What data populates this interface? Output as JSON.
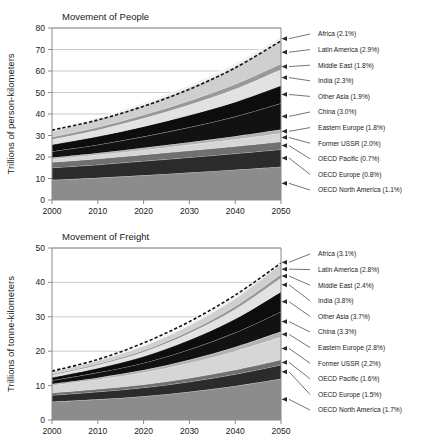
{
  "figure": {
    "background": "#ffffff",
    "panels": [
      "people",
      "freight"
    ]
  },
  "chart_data": [
    {
      "id": "people",
      "type": "area",
      "stacked": true,
      "title": "Movement of People",
      "xlabel": "",
      "ylabel": "Trillions of person-kilometers",
      "x": [
        2000,
        2010,
        2020,
        2030,
        2040,
        2050
      ],
      "xlim": [
        2000,
        2050
      ],
      "ylim": [
        0,
        80
      ],
      "yticks": [
        0,
        10,
        20,
        30,
        40,
        50,
        60,
        70,
        80
      ],
      "xticks": [
        2000,
        2010,
        2020,
        2030,
        2040,
        2050
      ],
      "xticklabels": [
        "2000",
        "2010",
        "2020",
        "2030",
        "2040",
        "2050"
      ],
      "yticklabels": [
        "0",
        "10",
        "20",
        "30",
        "40",
        "50",
        "60",
        "70",
        "80"
      ],
      "grid": "horizontal",
      "legend_position": "right-leader-lines",
      "total_line_label": "total (dashed)",
      "total": [
        32.5,
        37.2,
        43.6,
        51.5,
        61.5,
        74.0
      ],
      "series": [
        {
          "name": "OECD North America (1.1%)",
          "growth": "1.1%",
          "color": "#8c8c8c",
          "values": [
            9.3,
            10.3,
            11.5,
            12.8,
            14.1,
            15.5
          ]
        },
        {
          "name": "OECD Europe (0.8%)",
          "growth": "0.8%",
          "color": "#2b2b2b",
          "values": [
            5.7,
            6.1,
            6.6,
            7.0,
            7.5,
            8.0
          ]
        },
        {
          "name": "OECD Pacific (0.7%)",
          "growth": "0.7%",
          "color": "#707070",
          "values": [
            2.6,
            2.8,
            3.0,
            3.2,
            3.4,
            3.6
          ]
        },
        {
          "name": "Former USSR (2.0%)",
          "growth": "2.0%",
          "color": "#d6d6d6",
          "values": [
            1.5,
            1.9,
            2.2,
            2.7,
            3.3,
            4.0
          ]
        },
        {
          "name": "Eastern Europe (1.8%)",
          "growth": "1.8%",
          "color": "#b3b3b3",
          "values": [
            0.7,
            0.8,
            1.0,
            1.2,
            1.4,
            1.7
          ]
        },
        {
          "name": "China (3.0%)",
          "growth": "3.0%",
          "color": "#121212",
          "values": [
            2.8,
            3.8,
            5.2,
            6.9,
            9.1,
            12.2
          ]
        },
        {
          "name": "Other Asia (1.9%)",
          "growth": "1.9%",
          "color": "#0d0d0d",
          "values": [
            3.2,
            3.9,
            4.7,
            5.7,
            6.8,
            8.2
          ]
        },
        {
          "name": "India (2.3%)",
          "growth": "2.3%",
          "color": "#e2e2e2",
          "values": [
            2.4,
            3.0,
            3.8,
            4.8,
            6.0,
            7.5
          ]
        },
        {
          "name": "Middle East (1.8%)",
          "growth": "1.8%",
          "color": "#999999",
          "values": [
            1.1,
            1.3,
            1.6,
            1.9,
            2.3,
            2.7
          ]
        },
        {
          "name": "Latin America (2.9%)",
          "growth": "2.9%",
          "color": "#cfcfcf",
          "values": [
            2.6,
            3.5,
            4.6,
            6.1,
            8.1,
            10.7
          ]
        },
        {
          "name": "Africa (2.1%)",
          "growth": "2.1%",
          "color": "#f0f0f0",
          "values": [
            0.6,
            0.8,
            1.0,
            1.2,
            1.5,
            1.9
          ]
        }
      ]
    },
    {
      "id": "freight",
      "type": "area",
      "stacked": true,
      "title": "Movement of Freight",
      "xlabel": "",
      "ylabel": "Trillions of tonne-kilometers",
      "x": [
        2000,
        2010,
        2020,
        2030,
        2040,
        2050
      ],
      "xlim": [
        2000,
        2050
      ],
      "ylim": [
        0,
        50
      ],
      "yticks": [
        0,
        10,
        20,
        30,
        40,
        50
      ],
      "xticks": [
        2000,
        2010,
        2020,
        2030,
        2040,
        2050
      ],
      "xticklabels": [
        "2000",
        "2010",
        "2020",
        "2030",
        "2040",
        "2050"
      ],
      "yticklabels": [
        "0",
        "10",
        "20",
        "30",
        "40",
        "50"
      ],
      "grid": "horizontal",
      "legend_position": "right-leader-lines",
      "total_line_label": "total (dashed)",
      "total": [
        14.2,
        17.6,
        22.4,
        28.6,
        36.3,
        45.6
      ],
      "series": [
        {
          "name": "OECD North America (1.7%)",
          "growth": "1.7%",
          "color": "#8c8c8c",
          "values": [
            5.3,
            6.0,
            6.9,
            8.2,
            9.9,
            12.0
          ]
        },
        {
          "name": "OECD Europe (1.5%)",
          "growth": "1.5%",
          "color": "#2b2b2b",
          "values": [
            1.9,
            2.2,
            2.5,
            2.9,
            3.4,
            4.0
          ]
        },
        {
          "name": "OECD Pacific (1.6%)",
          "growth": "1.6%",
          "color": "#707070",
          "values": [
            0.7,
            0.8,
            0.9,
            1.1,
            1.3,
            1.5
          ]
        },
        {
          "name": "Former USSR (2.2%)",
          "growth": "2.2%",
          "color": "#d6d6d6",
          "values": [
            2.2,
            2.8,
            3.5,
            4.4,
            5.4,
            6.6
          ]
        },
        {
          "name": "Eastern Europe (2.8%)",
          "growth": "2.8%",
          "color": "#b3b3b3",
          "values": [
            0.4,
            0.5,
            0.7,
            0.9,
            1.2,
            1.6
          ]
        },
        {
          "name": "China (3.3%)",
          "growth": "3.3%",
          "color": "#121212",
          "values": [
            1.0,
            1.5,
            2.1,
            3.0,
            4.2,
            5.8
          ]
        },
        {
          "name": "Other Asia (3.7%)",
          "growth": "3.7%",
          "color": "#0d0d0d",
          "values": [
            0.9,
            1.3,
            1.9,
            2.8,
            4.0,
            5.8
          ]
        },
        {
          "name": "India (3.8%)",
          "growth": "3.8%",
          "color": "#e2e2e2",
          "values": [
            0.6,
            0.9,
            1.3,
            1.9,
            2.8,
            4.0
          ]
        },
        {
          "name": "Middle East (2.4%)",
          "growth": "2.4%",
          "color": "#999999",
          "values": [
            0.3,
            0.4,
            0.5,
            0.7,
            0.9,
            1.1
          ]
        },
        {
          "name": "Latin America (2.8%)",
          "growth": "2.8%",
          "color": "#cfcfcf",
          "values": [
            0.7,
            0.9,
            1.2,
            1.6,
            2.2,
            2.9
          ]
        },
        {
          "name": "Africa (3.1%)",
          "growth": "3.1%",
          "color": "#f0f0f0",
          "values": [
            0.2,
            0.3,
            0.4,
            0.6,
            0.8,
            1.1
          ]
        }
      ]
    }
  ]
}
